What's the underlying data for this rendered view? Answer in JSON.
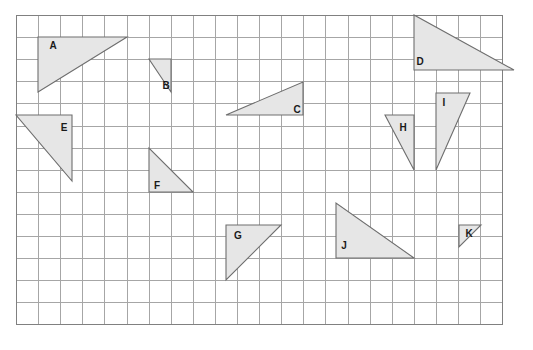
{
  "page": {
    "background_color": "#ffffff",
    "width": 533,
    "height": 350
  },
  "grid": {
    "name": "square-grid",
    "origin_x": 16,
    "origin_y": 15,
    "cell_size": 22.1,
    "columns": 22,
    "rows": 14,
    "line_color": "#a6a6a6",
    "border_color": "#808080",
    "show_grid": true
  },
  "style": {
    "shape_fill": "#e6e6e6",
    "shape_stroke": "#6e6e6e",
    "label_color": "#1a1a1a"
  },
  "chart_data": {
    "type": "scatter",
    "xlabel": "",
    "ylabel": "",
    "grid": true,
    "legend_position": "none",
    "xlim": [
      0,
      22
    ],
    "ylim": [
      0,
      14
    ],
    "shapes": [
      {
        "label": "A",
        "points": [
          [
            38,
            37
          ],
          [
            127,
            37
          ],
          [
            38,
            92
          ]
        ],
        "grid_points": [
          [
            1,
            1
          ],
          [
            5,
            1
          ],
          [
            1,
            3.5
          ]
        ],
        "right_angle_at": "top-left",
        "base_cells": 4,
        "height_cells": 2.5,
        "label_x": 53,
        "label_y": 46
      },
      {
        "label": "B",
        "points": [
          [
            149,
            59
          ],
          [
            171,
            59
          ],
          [
            171,
            92
          ]
        ],
        "grid_points": [
          [
            6,
            2
          ],
          [
            7,
            2
          ],
          [
            7,
            3.5
          ]
        ],
        "right_angle_at": "bottom-right",
        "base_cells": 1,
        "height_cells": 1.5,
        "label_x": 166,
        "label_y": 86
      },
      {
        "label": "C",
        "points": [
          [
            226,
            115
          ],
          [
            303,
            115
          ],
          [
            303,
            82
          ]
        ],
        "grid_points": [
          [
            9.5,
            4.5
          ],
          [
            13,
            4.5
          ],
          [
            13,
            3
          ]
        ],
        "right_angle_at": "bottom-right",
        "base_cells": 3.5,
        "height_cells": 1.5,
        "label_x": 297,
        "label_y": 110
      },
      {
        "label": "D",
        "points": [
          [
            414,
            15
          ],
          [
            414,
            70
          ],
          [
            514,
            70
          ]
        ],
        "grid_points": [
          [
            18,
            0
          ],
          [
            18,
            2.5
          ],
          [
            22.5,
            2.5
          ]
        ],
        "right_angle_at": "bottom-left",
        "base_cells": 4.5,
        "height_cells": 2.5,
        "label_x": 420,
        "label_y": 62
      },
      {
        "label": "E",
        "points": [
          [
            16,
            115
          ],
          [
            72,
            115
          ],
          [
            72,
            181
          ]
        ],
        "grid_points": [
          [
            0,
            4.5
          ],
          [
            2.5,
            4.5
          ],
          [
            2.5,
            7.5
          ]
        ],
        "right_angle_at": "top-right",
        "base_cells": 2.5,
        "height_cells": 3,
        "label_x": 64,
        "label_y": 128
      },
      {
        "label": "F",
        "points": [
          [
            149,
            148
          ],
          [
            149,
            192
          ],
          [
            193,
            192
          ]
        ],
        "grid_points": [
          [
            6,
            6
          ],
          [
            6,
            8
          ],
          [
            8,
            8
          ]
        ],
        "right_angle_at": "bottom-left",
        "base_cells": 2,
        "height_cells": 2,
        "label_x": 157,
        "label_y": 186
      },
      {
        "label": "G",
        "points": [
          [
            226,
            225
          ],
          [
            281,
            225
          ],
          [
            226,
            280
          ]
        ],
        "grid_points": [
          [
            9.5,
            9.5
          ],
          [
            12,
            9.5
          ],
          [
            9.5,
            12
          ]
        ],
        "right_angle_at": "top-left",
        "base_cells": 2.5,
        "height_cells": 2.5,
        "label_x": 238,
        "label_y": 236
      },
      {
        "label": "H",
        "points": [
          [
            385,
            115
          ],
          [
            414,
            115
          ],
          [
            414,
            170
          ]
        ],
        "grid_points": [
          [
            16.7,
            4.5
          ],
          [
            18,
            4.5
          ],
          [
            18,
            7
          ]
        ],
        "right_angle_at": "top-right",
        "base_cells": 1.3,
        "height_cells": 2.5,
        "label_x": 403,
        "label_y": 128
      },
      {
        "label": "I",
        "points": [
          [
            436,
            93
          ],
          [
            470,
            93
          ],
          [
            436,
            170
          ]
        ],
        "grid_points": [
          [
            19,
            3.5
          ],
          [
            20.5,
            3.5
          ],
          [
            19,
            7
          ]
        ],
        "right_angle_at": "top-left",
        "base_cells": 1.5,
        "height_cells": 3.5,
        "label_x": 444,
        "label_y": 103
      },
      {
        "label": "J",
        "points": [
          [
            336,
            203
          ],
          [
            336,
            258
          ],
          [
            414,
            258
          ]
        ],
        "grid_points": [
          [
            14.5,
            8.5
          ],
          [
            14.5,
            11
          ],
          [
            18,
            11
          ]
        ],
        "right_angle_at": "bottom-left",
        "base_cells": 3.5,
        "height_cells": 2.5,
        "label_x": 344,
        "label_y": 246
      },
      {
        "label": "K",
        "points": [
          [
            459,
            225
          ],
          [
            481,
            225
          ],
          [
            459,
            247
          ]
        ],
        "grid_points": [
          [
            20,
            9.5
          ],
          [
            21,
            9.5
          ],
          [
            20,
            10.5
          ]
        ],
        "right_angle_at": "top-left",
        "base_cells": 1,
        "height_cells": 1,
        "label_x": 469,
        "label_y": 234
      }
    ]
  }
}
